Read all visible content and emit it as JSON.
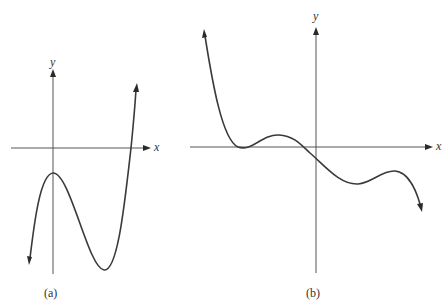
{
  "figure": {
    "panels": [
      {
        "id": "a",
        "caption": "(a)",
        "x_axis_label": "x",
        "y_axis_label": "y",
        "description": "Cubic-like polynomial: comes up from lower-left, local maximum below x-axis on the y-axis, local minimum to the right, then rises steeply crossing the x-axis once",
        "features": {
          "local_max": "on y-axis, below x-axis",
          "local_min": "right of y-axis, below x-axis",
          "x_intercepts": 1,
          "left_end": "down",
          "right_end": "up"
        }
      },
      {
        "id": "b",
        "caption": "(b)",
        "x_axis_label": "x",
        "y_axis_label": "y",
        "description": "Polynomial: comes down from upper-left, touches the x-axis (double root), rises to small local maximum, crosses x-axis left of origin, local minimum below axis, small local maximum, then falls to lower-right",
        "features": {
          "touch_point": "left of y-axis on x-axis",
          "x_intercepts": 2,
          "y_intercept": "slightly below origin",
          "left_end": "up",
          "right_end": "down"
        }
      }
    ],
    "colors": {
      "background": "#ffffff",
      "curve": "#3a3a3a",
      "axis": "#555555"
    }
  }
}
